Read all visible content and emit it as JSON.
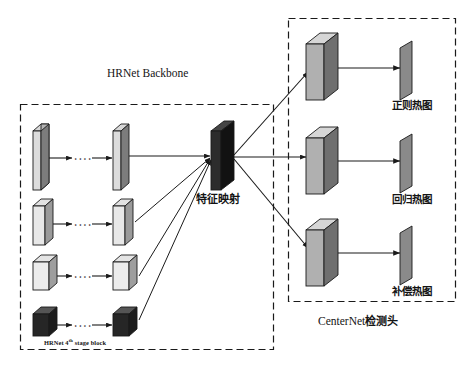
{
  "diagram": {
    "title_backbone": "HRNet Backbone",
    "title_head": "CenterNet",
    "title_head_cjk": "检测头",
    "stage_block_prefix": "HRNet 4",
    "stage_block_sup": "th",
    "stage_block_suffix": " stage block",
    "feature_map_label": "特征映射",
    "ellipsis": "• • • •"
  },
  "backbone": {
    "rows": [
      {
        "name": "branch-1",
        "label": "",
        "face_color": "#7c7c7c",
        "top_color": "#b4b4b4",
        "side_color": "#d8d8d8"
      },
      {
        "name": "branch-2",
        "label": "",
        "face_color": "#9a9a9a",
        "top_color": "#c9c9c9",
        "side_color": "#e2e2e2"
      },
      {
        "name": "branch-3",
        "label": "",
        "face_color": "#9e9e9e",
        "top_color": "#cccccc",
        "side_color": "#e4e4e4"
      },
      {
        "name": "branch-4",
        "label": "",
        "face_color": "#1c1c1c",
        "top_color": "#3a3a3a",
        "side_color": "#555555"
      }
    ]
  },
  "feature_map": {
    "name": "feature-map-block",
    "face_color": "#121212",
    "top_color": "#2c2c2c",
    "side_color": "#454545"
  },
  "head": {
    "branches": [
      {
        "name": "regular-heatmap",
        "label": "正则热图",
        "face_color": "#6f6f6f",
        "top_color": "#b0b0b0",
        "side_color": "#d6d6d6",
        "out_color": "#8a8a8a"
      },
      {
        "name": "regression-heatmap",
        "label": "回归热图",
        "face_color": "#6f6f6f",
        "top_color": "#b0b0b0",
        "side_color": "#d6d6d6",
        "out_color": "#8a8a8a"
      },
      {
        "name": "offset-heatmap",
        "label": "补偿热图",
        "face_color": "#6f6f6f",
        "top_color": "#b0b0b0",
        "side_color": "#d6d6d6",
        "out_color": "#8a8a8a"
      }
    ]
  },
  "style": {
    "stroke": "#1a1a1a",
    "dash_border": "#1a1a1a",
    "background": "#ffffff"
  }
}
